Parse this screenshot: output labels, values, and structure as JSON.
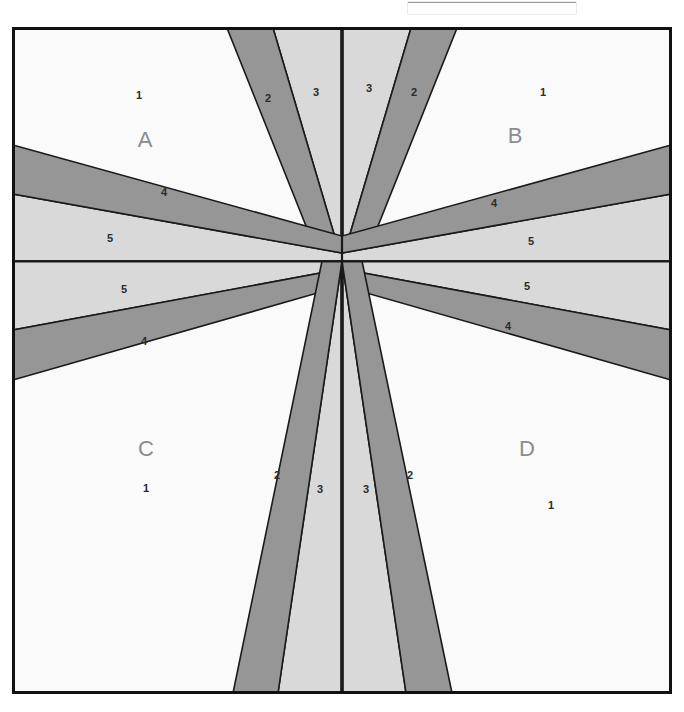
{
  "figure": {
    "colors": {
      "band_dark": "#969696",
      "band_light": "#d9d9d9",
      "background": "#fafafa",
      "outline": "#1a1a1a",
      "frame": "#111111",
      "quadrant_label": "#8c8c8c",
      "number_label": "#2b2b2b"
    },
    "frame": {
      "x": 12,
      "y": 27,
      "width": 660,
      "height": 667,
      "border_px": 3
    },
    "center": {
      "x": 342,
      "y": 261
    }
  },
  "quadrants": [
    {
      "id": "A",
      "label": "A",
      "position": "top-left",
      "label_x": 145,
      "label_y": 147
    },
    {
      "id": "B",
      "label": "B",
      "position": "top-right",
      "label_x": 515,
      "label_y": 143
    },
    {
      "id": "C",
      "label": "C",
      "position": "bottom-left",
      "label_x": 146,
      "label_y": 456
    },
    {
      "id": "D",
      "label": "D",
      "position": "bottom-right",
      "label_x": 527,
      "label_y": 456
    }
  ],
  "band_labels": [
    {
      "text": "1",
      "x": 139,
      "y": 99,
      "region": "A"
    },
    {
      "text": "2",
      "x": 268,
      "y": 102,
      "region": "A"
    },
    {
      "text": "3",
      "x": 316,
      "y": 96,
      "region": "A"
    },
    {
      "text": "4",
      "x": 164,
      "y": 196,
      "region": "A"
    },
    {
      "text": "5",
      "x": 110,
      "y": 242,
      "region": "A"
    },
    {
      "text": "3",
      "x": 369,
      "y": 92,
      "region": "B"
    },
    {
      "text": "2",
      "x": 414,
      "y": 96,
      "region": "B"
    },
    {
      "text": "1",
      "x": 543,
      "y": 96,
      "region": "B"
    },
    {
      "text": "4",
      "x": 494,
      "y": 207,
      "region": "B"
    },
    {
      "text": "5",
      "x": 531,
      "y": 245,
      "region": "B"
    },
    {
      "text": "5",
      "x": 124,
      "y": 293,
      "region": "C"
    },
    {
      "text": "4",
      "x": 144,
      "y": 345,
      "region": "C"
    },
    {
      "text": "1",
      "x": 146,
      "y": 492,
      "region": "C"
    },
    {
      "text": "2",
      "x": 277,
      "y": 479,
      "region": "C"
    },
    {
      "text": "3",
      "x": 320,
      "y": 493,
      "region": "C"
    },
    {
      "text": "5",
      "x": 527,
      "y": 290,
      "region": "D"
    },
    {
      "text": "4",
      "x": 508,
      "y": 330,
      "region": "D"
    },
    {
      "text": "3",
      "x": 366,
      "y": 493,
      "region": "D"
    },
    {
      "text": "2",
      "x": 410,
      "y": 479,
      "region": "D"
    },
    {
      "text": "1",
      "x": 551,
      "y": 509,
      "region": "D"
    }
  ],
  "bands": {
    "note": "Bands radiate from the centre point and are mirrored across both axes.",
    "dark_band_name": "band-2-and-4",
    "light_band_name": "band-3-and-5"
  }
}
